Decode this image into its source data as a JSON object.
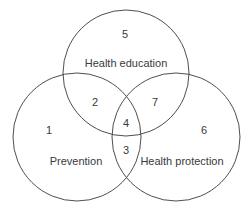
{
  "diagram": {
    "type": "venn",
    "stroke_color": "#3a3a3a",
    "background": "#ffffff",
    "circles": [
      {
        "name": "Health education",
        "cx": 126,
        "cy": 73,
        "r": 63
      },
      {
        "name": "Prevention",
        "cx": 77,
        "cy": 137,
        "r": 64
      },
      {
        "name": "Health protection",
        "cx": 176,
        "cy": 137,
        "r": 64
      }
    ],
    "labels": {
      "health_education": "Health education",
      "prevention": "Prevention",
      "health_protection": "Health protection"
    },
    "regions": {
      "r1": "1",
      "r2": "2",
      "r3": "3",
      "r4": "4",
      "r5": "5",
      "r6": "6",
      "r7": "7"
    }
  }
}
